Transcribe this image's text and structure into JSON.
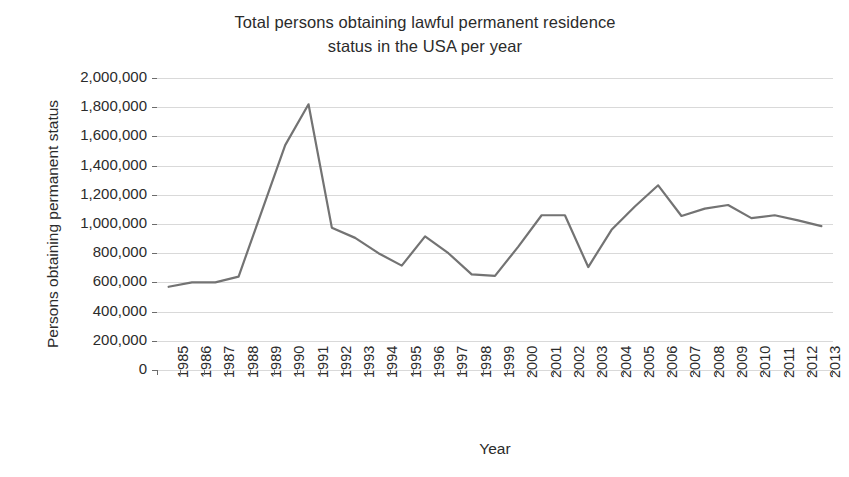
{
  "chart_data": {
    "type": "line",
    "title": "Total persons obtaining lawful permanent residence status in the USA per year",
    "title_line1": "Total persons obtaining lawful permanent residence",
    "title_line2": "status in the USA per year",
    "xlabel": "Year",
    "ylabel": "Persons obtaining permanent status",
    "ylim": [
      0,
      2000000
    ],
    "ytick_labels": [
      "2,000,000",
      "1,800,000",
      "1,600,000",
      "1,400,000",
      "1,200,000",
      "1,000,000",
      "800,000",
      "600,000",
      "400,000",
      "200,000",
      "0"
    ],
    "ytick_values": [
      2000000,
      1800000,
      1600000,
      1400000,
      1200000,
      1000000,
      800000,
      600000,
      400000,
      200000,
      0
    ],
    "grid": true,
    "legend": "none",
    "series_color": "#737373",
    "grid_color": "#d9d9d9",
    "categories": [
      "1985",
      "1986",
      "1987",
      "1988",
      "1989",
      "1990",
      "1991",
      "1992",
      "1993",
      "1994",
      "1995",
      "1996",
      "1997",
      "1998",
      "1999",
      "2000",
      "2001",
      "2002",
      "2003",
      "2004",
      "2005",
      "2006",
      "2007",
      "2008",
      "2009",
      "2010",
      "2011",
      "2012",
      "2013"
    ],
    "values": [
      570000,
      600000,
      600000,
      640000,
      1090000,
      1540000,
      1820000,
      975000,
      905000,
      800000,
      715000,
      915000,
      800000,
      655000,
      645000,
      845000,
      1060000,
      1060000,
      705000,
      960000,
      1120000,
      1265000,
      1055000,
      1105000,
      1130000,
      1040000,
      1060000,
      1025000,
      985000
    ]
  }
}
